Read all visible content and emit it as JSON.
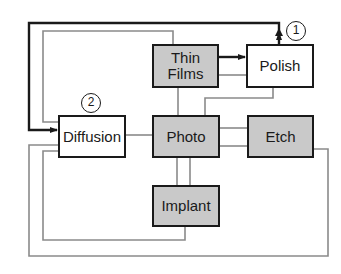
{
  "diagram": {
    "nodes": [
      {
        "id": "thin-films",
        "label": "Thin\nFilms",
        "shaded": true
      },
      {
        "id": "polish",
        "label": "Polish",
        "shaded": false
      },
      {
        "id": "diffusion",
        "label": "Diffusion",
        "shaded": false
      },
      {
        "id": "photo",
        "label": "Photo",
        "shaded": true
      },
      {
        "id": "etch",
        "label": "Etch",
        "shaded": true
      },
      {
        "id": "implant",
        "label": "Implant",
        "shaded": true
      }
    ],
    "badges": [
      {
        "id": "badge-1",
        "label": "1",
        "near": "polish"
      },
      {
        "id": "badge-2",
        "label": "2",
        "near": "diffusion"
      }
    ],
    "edges": [
      {
        "from": "thin-films",
        "to": "polish",
        "style": "black-arrow"
      },
      {
        "from": "polish",
        "to": "diffusion",
        "style": "black-arrow",
        "route": "over-top"
      },
      {
        "from": "thin-films",
        "to": "polish",
        "style": "gray"
      },
      {
        "from": "thin-films",
        "to": "diffusion",
        "style": "gray",
        "route": "over-top"
      },
      {
        "from": "thin-films",
        "to": "photo",
        "style": "gray"
      },
      {
        "from": "polish",
        "to": "photo",
        "style": "gray"
      },
      {
        "from": "diffusion",
        "to": "photo",
        "style": "gray"
      },
      {
        "from": "photo",
        "to": "etch",
        "style": "gray",
        "count": 2
      },
      {
        "from": "photo",
        "to": "implant",
        "style": "gray",
        "count": 2
      },
      {
        "from": "implant",
        "to": "diffusion",
        "style": "gray",
        "route": "bottom-loop"
      },
      {
        "from": "etch",
        "to": "diffusion",
        "style": "gray",
        "route": "outer-bottom-loop"
      }
    ],
    "colors": {
      "stroke": "#1a1a1a",
      "gray_line": "#8a8a8a",
      "shaded_fill": "#c9c9c9"
    }
  }
}
